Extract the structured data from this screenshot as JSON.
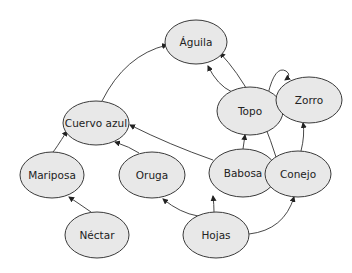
{
  "diagram": {
    "type": "food-web",
    "colors": {
      "node_fill": "#e8e8e8",
      "node_stroke": "#3a3a3a",
      "edge": "#333333",
      "background": "#ffffff"
    },
    "nodes": [
      {
        "id": "aguila",
        "label": "Águila",
        "cx": 196,
        "cy": 42,
        "rx": 31,
        "ry": 22
      },
      {
        "id": "cuervo",
        "label": "Cuervo azul",
        "cx": 96,
        "cy": 123,
        "rx": 33,
        "ry": 22
      },
      {
        "id": "topo",
        "label": "Topo",
        "cx": 250,
        "cy": 111,
        "rx": 33,
        "ry": 24
      },
      {
        "id": "zorro",
        "label": "Zorro",
        "cx": 309,
        "cy": 100,
        "rx": 33,
        "ry": 23
      },
      {
        "id": "mariposa",
        "label": "Mariposa",
        "cx": 52,
        "cy": 175,
        "rx": 32,
        "ry": 23
      },
      {
        "id": "oruga",
        "label": "Oruga",
        "cx": 152,
        "cy": 175,
        "rx": 33,
        "ry": 23
      },
      {
        "id": "babosa",
        "label": "Babosa",
        "cx": 243,
        "cy": 173,
        "rx": 34,
        "ry": 24
      },
      {
        "id": "conejo",
        "label": "Conejo",
        "cx": 298,
        "cy": 174,
        "rx": 33,
        "ry": 23
      },
      {
        "id": "nectar",
        "label": "Néctar",
        "cx": 97,
        "cy": 235,
        "rx": 32,
        "ry": 23
      },
      {
        "id": "hojas",
        "label": "Hojas",
        "cx": 216,
        "cy": 235,
        "rx": 33,
        "ry": 23
      }
    ],
    "edges": [
      {
        "from": "nectar",
        "to": "mariposa",
        "path": "M 91 212 Q 78 203 69 197"
      },
      {
        "from": "mariposa",
        "to": "cuervo",
        "path": "M 53 152 Q 55 150 67 131"
      },
      {
        "from": "oruga",
        "to": "cuervo",
        "path": "M 139 153 Q 130 147 115 142"
      },
      {
        "from": "babosa",
        "to": "cuervo",
        "path": "M 213 160 Q 170 145 130 125"
      },
      {
        "from": "cuervo",
        "to": "aguila",
        "path": "M 102 101 Q 125 55 167 45"
      },
      {
        "from": "topo",
        "to": "aguila",
        "path": "M 232 92 Q 217 85 208 66"
      },
      {
        "from": "topo",
        "to": "zorro",
        "path": "M 268 94 Q 275 65 286 71 Q 292 75 285 80"
      },
      {
        "from": "babosa",
        "to": "topo",
        "path": "M 243 149 L 245 135"
      },
      {
        "from": "conejo",
        "to": "aguila",
        "path": "M 276 157 Q 255 90 220 53"
      },
      {
        "from": "conejo",
        "to": "zorro",
        "path": "M 301 151 Q 305 135 303 123"
      },
      {
        "from": "hojas",
        "to": "oruga",
        "path": "M 198 216 Q 180 213 163 199"
      },
      {
        "from": "hojas",
        "to": "babosa",
        "path": "M 214 212 Q 214 205 213 196"
      },
      {
        "from": "hojas",
        "to": "conejo",
        "path": "M 249 234 Q 284 230 294 197"
      }
    ]
  }
}
